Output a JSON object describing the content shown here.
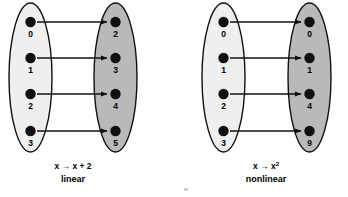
{
  "figure": {
    "background_color": "#ffffff",
    "ink_color": "#101010",
    "domain_fill": "#efefef",
    "codomain_fill": "#b9b9b9"
  },
  "diagrams": [
    {
      "id": "linear",
      "caption_formula": "x → x + 2",
      "caption_formula_base": "x → x + 2",
      "caption_formula_superscript": "",
      "caption_kind": "linear",
      "domain": {
        "name": "domain-set",
        "fill": "#efefef",
        "values": [
          "0",
          "1",
          "2",
          "3"
        ]
      },
      "codomain": {
        "name": "codomain-set",
        "fill": "#b9b9b9",
        "values": [
          "2",
          "3",
          "4",
          "5"
        ]
      },
      "mappings": [
        {
          "from": "0",
          "to": "2",
          "from_index": 0,
          "to_index": 0
        },
        {
          "from": "1",
          "to": "3",
          "from_index": 1,
          "to_index": 1
        },
        {
          "from": "2",
          "to": "4",
          "from_index": 2,
          "to_index": 2
        },
        {
          "from": "3",
          "to": "5",
          "from_index": 3,
          "to_index": 3
        }
      ]
    },
    {
      "id": "nonlinear",
      "caption_formula": "x → x²",
      "caption_formula_base": "x → x",
      "caption_formula_superscript": "2",
      "caption_kind": "nonlinear",
      "domain": {
        "name": "domain-set",
        "fill": "#efefef",
        "values": [
          "0",
          "1",
          "2",
          "3"
        ]
      },
      "codomain": {
        "name": "codomain-set",
        "fill": "#b9b9b9",
        "values": [
          "0",
          "1",
          "4",
          "9"
        ]
      },
      "mappings": [
        {
          "from": "0",
          "to": "0",
          "from_index": 0,
          "to_index": 0
        },
        {
          "from": "1",
          "to": "1",
          "from_index": 1,
          "to_index": 1
        },
        {
          "from": "2",
          "to": "4",
          "from_index": 2,
          "to_index": 2
        },
        {
          "from": "3",
          "to": "9",
          "from_index": 3,
          "to_index": 3
        }
      ]
    }
  ]
}
